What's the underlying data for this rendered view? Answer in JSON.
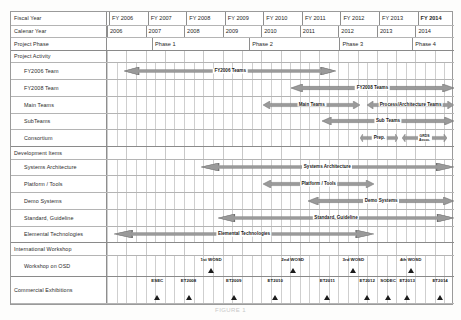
{
  "caption": "FIGURE 1",
  "colors": {
    "bar_fill": "#9a9a9a",
    "bar_stroke": "#6f6f6f",
    "grid": "#c8c8c8",
    "border": "#8e8e8e",
    "marker": "#1c1c1c"
  },
  "header": {
    "fiscal_year_label": "Fiscal Year",
    "calendar_year_label": "Calenar Year",
    "project_phase_label": "Project Phase",
    "fiscal_years": [
      {
        "label": "FY 2006",
        "bold": false
      },
      {
        "label": "FY 2007",
        "bold": false
      },
      {
        "label": "FY 2008",
        "bold": false
      },
      {
        "label": "FY 2009",
        "bold": false
      },
      {
        "label": "FY 2010",
        "bold": false
      },
      {
        "label": "FY 2011",
        "bold": false
      },
      {
        "label": "FY 2012",
        "bold": false
      },
      {
        "label": "FY 2013",
        "bold": false
      },
      {
        "label": "FY 2014",
        "bold": true
      }
    ],
    "calendar_years": [
      "2006",
      "2007",
      "2008",
      "2009",
      "2010",
      "2011",
      "2012",
      "2013",
      "2014"
    ],
    "phases": [
      {
        "label": "Phase 1"
      },
      {
        "label": "Phase 2"
      },
      {
        "label": "Phase 3"
      },
      {
        "label": "Phase 4"
      }
    ]
  },
  "sections": {
    "project_activity": {
      "title": "Project Activity",
      "rows": [
        {
          "label": "FY2006 Team",
          "bar_label": "FY2006 Teams"
        },
        {
          "label": "FY2008 Team",
          "bar_label": "FY2008 Teams"
        },
        {
          "label": "Main Teams",
          "bar_label": "Main Teams",
          "bar_label2": "Process/Architecture Teams"
        },
        {
          "label": "SubTeams",
          "bar_label": "Sub Teams"
        },
        {
          "label": "Consortium",
          "bar_label": "Prep.",
          "bar_label2": "GRDS\nAssoc."
        }
      ]
    },
    "development_items": {
      "title": "Development Items",
      "rows": [
        {
          "label": "Systems Architecture",
          "bar_label": "Systems Architecture"
        },
        {
          "label": "Platform / Tools",
          "bar_label": "Platform / Tools"
        },
        {
          "label": "Demo Systems",
          "bar_label": "Demo Systems"
        },
        {
          "label": "Standard, Guideline",
          "bar_label": "Standard, Guideline"
        },
        {
          "label": "Elemental Technologies",
          "bar_label": "Elemental Technologies"
        }
      ]
    },
    "international_workshop": {
      "title": "International Workshop",
      "rows": [
        {
          "label": "Workshop on OSD"
        }
      ],
      "markers": [
        {
          "label": "1st WOSD",
          "x_pct": 30.0
        },
        {
          "label": "2nd WOSD",
          "x_pct": 53.5
        },
        {
          "label": "3rd WOSD",
          "x_pct": 71.0
        },
        {
          "label": "4th WOSD",
          "x_pct": 87.5
        }
      ]
    },
    "commercial_exhibitions": {
      "title": "Commercial Exhibitions",
      "markers": [
        {
          "label": "ESEC",
          "x_pct": 14.5
        },
        {
          "label": "ET2008",
          "x_pct": 23.5
        },
        {
          "label": "ET2009",
          "x_pct": 36.5
        },
        {
          "label": "ET2010",
          "x_pct": 48.5
        },
        {
          "label": "ET2011",
          "x_pct": 63.5
        },
        {
          "label": "ET2012",
          "x_pct": 75.0
        },
        {
          "label": "SODEC",
          "x_pct": 81.0
        },
        {
          "label": "ET2013",
          "x_pct": 86.5
        },
        {
          "label": "ET2014",
          "x_pct": 96.0
        }
      ]
    }
  },
  "chart_data": {
    "type": "bar",
    "xlabel": "Fiscal Year",
    "ylabel": "",
    "grid": true,
    "legend": "none",
    "x_axis": {
      "fiscal_years": [
        "FY 2006",
        "FY 2007",
        "FY 2008",
        "FY 2009",
        "FY 2010",
        "FY 2011",
        "FY 2012",
        "FY 2013",
        "FY 2014"
      ],
      "calendar_years": [
        "2006",
        "2007",
        "2008",
        "2009",
        "2010",
        "2011",
        "2012",
        "2013",
        "2014"
      ],
      "range_pct": [
        0,
        100
      ]
    },
    "phase_bands": [
      {
        "name": "Phase 1",
        "start_pct": 13.0,
        "end_pct": 41.0
      },
      {
        "name": "Phase 2",
        "start_pct": 41.0,
        "end_pct": 67.0
      },
      {
        "name": "Phase 3",
        "start_pct": 67.0,
        "end_pct": 88.0
      },
      {
        "name": "Phase 4",
        "start_pct": 88.0,
        "end_pct": 100.0
      }
    ],
    "bars": [
      {
        "row": "FY2006 Team",
        "label": "FY2006 Teams",
        "start_pct": 5.0,
        "end_pct": 66.0,
        "arrows": "both"
      },
      {
        "row": "FY2008 Team",
        "label": "FY2008 Teams",
        "start_pct": 53.0,
        "end_pct": 100.0,
        "arrows": "both"
      },
      {
        "row": "Main Teams",
        "label": "Main Teams",
        "start_pct": 45.0,
        "end_pct": 73.0,
        "arrows": "both"
      },
      {
        "row": "Main Teams",
        "label": "Process/Architecture Teams",
        "start_pct": 75.0,
        "end_pct": 100.0,
        "arrows": "both"
      },
      {
        "row": "SubTeams",
        "label": "Sub Teams",
        "start_pct": 62.0,
        "end_pct": 100.0,
        "arrows": "both"
      },
      {
        "row": "Consortium",
        "label": "Prep.",
        "start_pct": 73.0,
        "end_pct": 84.0,
        "arrows": "both"
      },
      {
        "row": "Consortium",
        "label": "GRDS Assoc.",
        "start_pct": 85.0,
        "end_pct": 98.0,
        "arrows": "both"
      },
      {
        "row": "Systems Architecture",
        "label": "Systems Architecture",
        "start_pct": 27.0,
        "end_pct": 100.0,
        "arrows": "both"
      },
      {
        "row": "Platform / Tools",
        "label": "Platform / Tools",
        "start_pct": 45.0,
        "end_pct": 77.0,
        "arrows": "both"
      },
      {
        "row": "Demo Systems",
        "label": "Demo Systems",
        "start_pct": 58.0,
        "end_pct": 100.0,
        "arrows": "both"
      },
      {
        "row": "Standard, Guideline",
        "label": "Standard, Guideline",
        "start_pct": 32.0,
        "end_pct": 100.0,
        "arrows": "both"
      },
      {
        "row": "Elemental Technologies",
        "label": "Elemental Technologies",
        "start_pct": 2.0,
        "end_pct": 77.0,
        "arrows": "both"
      }
    ],
    "milestones": [
      {
        "row": "Workshop on OSD",
        "label": "1st WOSD",
        "x_pct": 30.0
      },
      {
        "row": "Workshop on OSD",
        "label": "2nd WOSD",
        "x_pct": 53.5
      },
      {
        "row": "Workshop on OSD",
        "label": "3rd WOSD",
        "x_pct": 71.0
      },
      {
        "row": "Workshop on OSD",
        "label": "4th WOSD",
        "x_pct": 87.5
      },
      {
        "row": "Commercial Exhibitions",
        "label": "ESEC",
        "x_pct": 14.5
      },
      {
        "row": "Commercial Exhibitions",
        "label": "ET2008",
        "x_pct": 23.5
      },
      {
        "row": "Commercial Exhibitions",
        "label": "ET2009",
        "x_pct": 36.5
      },
      {
        "row": "Commercial Exhibitions",
        "label": "ET2010",
        "x_pct": 48.5
      },
      {
        "row": "Commercial Exhibitions",
        "label": "ET2011",
        "x_pct": 63.5
      },
      {
        "row": "Commercial Exhibitions",
        "label": "ET2012",
        "x_pct": 75.0
      },
      {
        "row": "Commercial Exhibitions",
        "label": "SODEC",
        "x_pct": 81.0
      },
      {
        "row": "Commercial Exhibitions",
        "label": "ET2013",
        "x_pct": 86.5
      },
      {
        "row": "Commercial Exhibitions",
        "label": "ET2014",
        "x_pct": 96.0
      }
    ]
  }
}
